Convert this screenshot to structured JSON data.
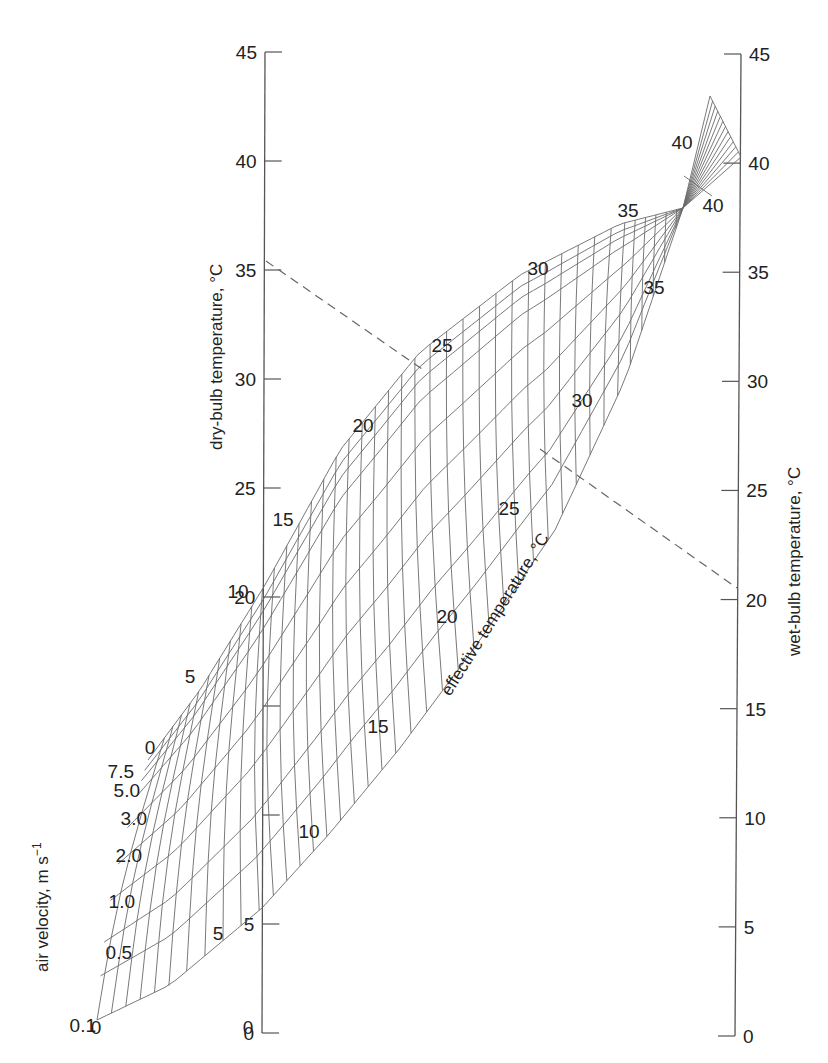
{
  "chart_data": {
    "type": "nomogram",
    "title": "",
    "left_axis": {
      "label": "dry-bulb temperature, °C",
      "ticks": [
        0,
        5,
        10,
        15,
        20,
        25,
        30,
        35,
        40,
        45
      ],
      "range": [
        0,
        45
      ]
    },
    "right_axis": {
      "label": "wet-bulb temperature, °C",
      "ticks": [
        0,
        5,
        10,
        15,
        20,
        25,
        30,
        35,
        40,
        45
      ],
      "range": [
        0,
        45
      ]
    },
    "velocity_axis": {
      "label": "air velocity, m s",
      "label_superscript": "−1",
      "curves": [
        "0.1",
        "0.5",
        "1.0",
        "2.0",
        "3.0",
        "5.0",
        "7.5"
      ]
    },
    "effective_temperature": {
      "label": "effective temperature, °C",
      "values": [
        0,
        5,
        10,
        15,
        20,
        25,
        30,
        35,
        40
      ],
      "upper_labels": [
        "0",
        "5",
        "10",
        "15",
        "20",
        "25",
        "30",
        "35",
        "40"
      ],
      "lower_labels": [
        "0",
        "5",
        "10",
        "15",
        "20",
        "25",
        "30",
        "35",
        "40"
      ]
    },
    "example_line": {
      "style": "dashed",
      "dry_bulb": 35.5,
      "wet_bulb": 20.5
    },
    "grid": false,
    "legend": "none"
  },
  "labels": {
    "left_ticks": [
      "0",
      "5",
      "20",
      "25",
      "30",
      "35",
      "40",
      "45"
    ],
    "right_ticks": [
      "0",
      "5",
      "10",
      "15",
      "20",
      "25",
      "30",
      "35",
      "40",
      "45"
    ],
    "velocity": [
      "0.1",
      "0.5",
      "1.0",
      "2.0",
      "3.0",
      "5.0",
      "7.5"
    ],
    "et_upper": [
      {
        "text": "0",
        "x": 150,
        "y": 754
      },
      {
        "text": "5",
        "x": 190,
        "y": 683
      },
      {
        "text": "10",
        "x": 238,
        "y": 598
      },
      {
        "text": "15",
        "x": 283,
        "y": 526
      },
      {
        "text": "20",
        "x": 363,
        "y": 432
      },
      {
        "text": "25",
        "x": 442,
        "y": 352
      },
      {
        "text": "30",
        "x": 538,
        "y": 275
      },
      {
        "text": "35",
        "x": 628,
        "y": 217
      },
      {
        "text": "40",
        "x": 682,
        "y": 149
      }
    ],
    "et_lower": [
      {
        "text": "0",
        "x": 96,
        "y": 1034
      },
      {
        "text": "5",
        "x": 218,
        "y": 940
      },
      {
        "text": "0",
        "x": 248,
        "y": 1034
      },
      {
        "text": "10",
        "x": 309,
        "y": 838
      },
      {
        "text": "15",
        "x": 378,
        "y": 733
      },
      {
        "text": "20",
        "x": 447,
        "y": 623
      },
      {
        "text": "25",
        "x": 509,
        "y": 515
      },
      {
        "text": "30",
        "x": 582,
        "y": 407
      },
      {
        "text": "35",
        "x": 654,
        "y": 294
      },
      {
        "text": "40",
        "x": 713,
        "y": 212
      }
    ],
    "titles": {
      "dry_bulb": "dry-bulb temperature, °C",
      "wet_bulb": "wet-bulb temperature, °C",
      "effective": "effective temperature, °C",
      "velocity": "air velocity, m s",
      "velocity_sup": "−1"
    }
  }
}
